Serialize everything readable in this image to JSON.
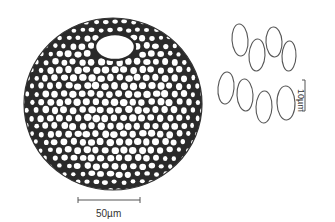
{
  "figure": {
    "scale_bars": [
      {
        "label": "50µm",
        "orientation": "horizontal"
      },
      {
        "label": "10µm",
        "orientation": "vertical"
      }
    ],
    "spore_count": 8
  },
  "colors": {
    "ink": "#2a2a2a",
    "cell_fill": "#ffffff",
    "background": "#ffffff",
    "wall": "#333333"
  }
}
